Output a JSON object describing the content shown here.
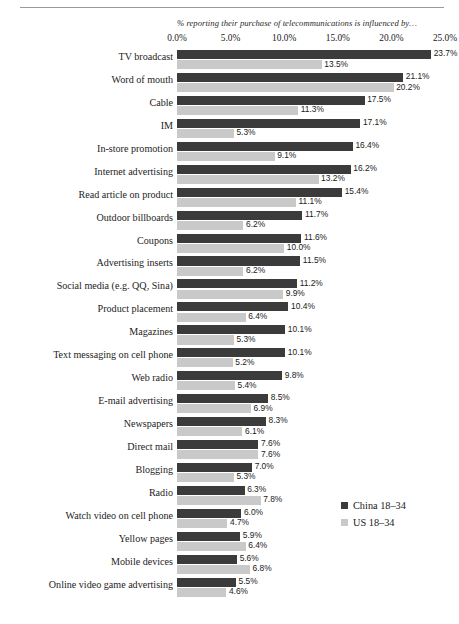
{
  "chart_data": {
    "type": "bar",
    "orientation": "horizontal",
    "title": "% reporting their purchase of telecommunications is influenced by…",
    "xlabel": "",
    "ylabel": "",
    "xlim": [
      0,
      25
    ],
    "grid": false,
    "legend_position": "bottom-right",
    "tick_labels": [
      "0.0%",
      "5.0%",
      "10.0%",
      "15.0%",
      "20.0%",
      "25.0%"
    ],
    "tick_values": [
      0,
      5,
      10,
      15,
      20,
      25
    ],
    "categories": [
      "TV broadcast",
      "Word of mouth",
      "Cable",
      "IM",
      "In-store promotion",
      "Internet advertising",
      "Read article on product",
      "Outdoor billboards",
      "Coupons",
      "Advertising inserts",
      "Social media (e.g. QQ, Sina)",
      "Product placement",
      "Magazines",
      "Text messaging on cell phone",
      "Web radio",
      "E-mail advertising",
      "Newspapers",
      "Direct mail",
      "Blogging",
      "Radio",
      "Watch video on cell phone",
      "Yellow pages",
      "Mobile devices",
      "Online video game advertising"
    ],
    "series": [
      {
        "name": "China 18–34",
        "color": "#3b3b3b",
        "values": [
          23.7,
          21.1,
          17.5,
          17.1,
          16.4,
          16.2,
          15.4,
          11.7,
          11.6,
          11.5,
          11.2,
          10.4,
          10.1,
          10.1,
          9.8,
          8.5,
          8.3,
          7.6,
          7.0,
          6.3,
          6.0,
          5.9,
          5.6,
          5.5
        ],
        "labels": [
          "23.7%",
          "21.1%",
          "17.5%",
          "17.1%",
          "16.4%",
          "16.2%",
          "15.4%",
          "11.7%",
          "11.6%",
          "11.5%",
          "11.2%",
          "10.4%",
          "10.1%",
          "10.1%",
          "9.8%",
          "8.5%",
          "8.3%",
          "7.6%",
          "7.0%",
          "6.3%",
          "6.0%",
          "5.9%",
          "5.6%",
          "5.5%"
        ]
      },
      {
        "name": "US 18–34",
        "color": "#c9c9c9",
        "values": [
          13.5,
          20.2,
          11.3,
          5.3,
          9.1,
          13.2,
          11.1,
          6.2,
          10.0,
          6.2,
          9.9,
          6.4,
          5.3,
          5.2,
          5.4,
          6.9,
          6.1,
          7.6,
          5.3,
          7.8,
          4.7,
          6.4,
          6.8,
          4.6
        ],
        "labels": [
          "13.5%",
          "20.2%",
          "11.3%",
          "5.3%",
          "9.1%",
          "13.2%",
          "11.1%",
          "6.2%",
          "10.0%",
          "6.2%",
          "9.9%",
          "6.4%",
          "5.3%",
          "5.2%",
          "5.4%",
          "6.9%",
          "6.1%",
          "7.6%",
          "5.3%",
          "7.8%",
          "4.7%",
          "6.4%",
          "6.8%",
          "4.6%"
        ]
      }
    ]
  },
  "legend": {
    "items": [
      {
        "label": "China 18–34",
        "color": "#3b3b3b",
        "swatch_name": "legend-swatch-china"
      },
      {
        "label": "US 18–34",
        "color": "#c9c9c9",
        "swatch_name": "legend-swatch-us"
      }
    ]
  }
}
